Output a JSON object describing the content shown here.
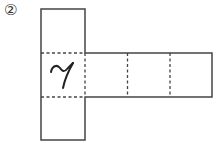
{
  "diagram": {
    "number_label": "②",
    "cell_character": "ア",
    "colors": {
      "line": "#444444",
      "background": "#ffffff"
    }
  }
}
